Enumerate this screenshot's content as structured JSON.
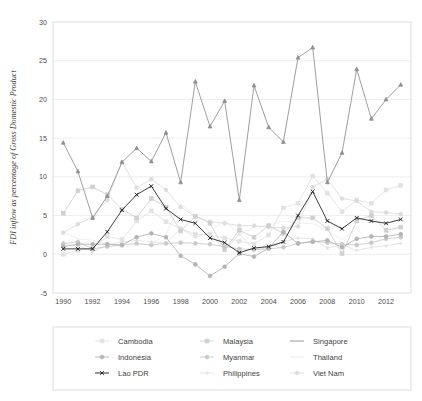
{
  "figure": {
    "width": 422,
    "height": 401,
    "background": "#ffffff"
  },
  "chart_data": {
    "type": "line",
    "title": "",
    "subtitle": "",
    "xlabel": "",
    "ylabel": "FDI inflow as percentage of Gross Domestic Product",
    "xlim": [
      1989.3,
      2013.7
    ],
    "ylim": [
      -5,
      30
    ],
    "yticks": [
      -5,
      0,
      5,
      10,
      15,
      20,
      25,
      30
    ],
    "ytick_labels": [
      "-5",
      "0",
      "5",
      "10",
      "15",
      "20",
      "25",
      "30"
    ],
    "xticks": [
      1990,
      1992,
      1994,
      1996,
      1998,
      2000,
      2002,
      2004,
      2006,
      2008,
      2010,
      2012
    ],
    "xtick_labels": [
      "1990",
      "1992",
      "1994",
      "1996",
      "1998",
      "2000",
      "2002",
      "2004",
      "2006",
      "2008",
      "2010",
      "2012"
    ],
    "grid": "horizontal",
    "legend_position": "below",
    "legend_columns": 3,
    "x": [
      1990,
      1991,
      1992,
      1993,
      1994,
      1995,
      1996,
      1997,
      1998,
      1999,
      2000,
      2001,
      2002,
      2003,
      2004,
      2005,
      2006,
      2007,
      2008,
      2009,
      2010,
      2011,
      2012,
      2013
    ],
    "series": [
      {
        "name": "Cambodia",
        "color": "#e2e2e2",
        "marker": "square",
        "values": [
          0.0,
          0.5,
          0.8,
          2.3,
          1.9,
          4.3,
          5.6,
          4.2,
          3.3,
          2.6,
          2.5,
          2.1,
          1.7,
          1.3,
          2.5,
          6.0,
          6.6,
          10.1,
          7.9,
          5.5,
          7.0,
          6.6,
          8.3,
          8.9
        ]
      },
      {
        "name": "Indonesia",
        "color": "#b4b4b4",
        "marker": "circle",
        "values": [
          1.0,
          1.3,
          1.3,
          1.3,
          1.2,
          2.2,
          2.7,
          2.2,
          -0.2,
          -1.3,
          -2.8,
          -1.6,
          0.1,
          -0.3,
          0.8,
          2.9,
          1.4,
          1.6,
          1.8,
          0.9,
          2.0,
          2.3,
          2.3,
          2.6
        ]
      },
      {
        "name": "Lao PDR",
        "color": "#1a1a1a",
        "marker": "x",
        "values": [
          0.7,
          0.7,
          0.7,
          2.9,
          5.7,
          7.7,
          8.8,
          5.9,
          4.5,
          4.0,
          2.1,
          1.5,
          0.2,
          0.8,
          1.0,
          1.6,
          5.0,
          8.1,
          4.3,
          3.3,
          4.7,
          4.3,
          4.0,
          4.5
        ]
      },
      {
        "name": "Malaysia",
        "color": "#d0d0d0",
        "marker": "square",
        "values": [
          5.3,
          8.2,
          8.7,
          7.7,
          5.8,
          4.7,
          7.2,
          6.1,
          3.0,
          4.9,
          4.0,
          0.6,
          3.1,
          2.2,
          3.7,
          2.7,
          4.7,
          4.7,
          3.3,
          0.1,
          4.3,
          5.0,
          3.1,
          3.5
        ]
      },
      {
        "name": "Myanmar",
        "color": "#c9c9c9",
        "marker": "circle",
        "values": [
          1.4,
          1.6,
          0.7,
          1.0,
          1.2,
          1.4,
          1.2,
          1.4,
          1.5,
          1.4,
          1.3,
          1.0,
          0.7,
          0.6,
          0.7,
          0.9,
          1.4,
          1.7,
          1.5,
          1.3,
          1.2,
          1.5,
          2.0,
          2.2
        ]
      },
      {
        "name": "Philippines",
        "color": "#e0e0e0",
        "marker": "plus",
        "values": [
          1.2,
          1.2,
          0.3,
          1.2,
          1.6,
          1.8,
          1.6,
          1.4,
          3.3,
          2.2,
          2.8,
          0.5,
          2.6,
          0.6,
          0.9,
          1.6,
          2.1,
          2.0,
          0.8,
          1.2,
          0.5,
          0.9,
          1.1,
          1.4
        ]
      },
      {
        "name": "Singapore",
        "color": "#8e8e8e",
        "marker": "triangle",
        "values": [
          14.4,
          10.7,
          4.7,
          7.5,
          11.9,
          13.7,
          12.0,
          15.7,
          9.3,
          22.3,
          16.5,
          19.8,
          7.0,
          21.8,
          16.4,
          14.5,
          25.4,
          26.7,
          9.3,
          13.1,
          23.9,
          17.5,
          20.0,
          21.9
        ]
      },
      {
        "name": "Thailand",
        "color": "#ececec",
        "marker": "none",
        "values": [
          2.9,
          2.0,
          1.8,
          1.4,
          0.9,
          1.2,
          1.3,
          2.6,
          6.5,
          5.0,
          2.8,
          4.4,
          2.5,
          3.5,
          3.7,
          4.3,
          4.0,
          4.0,
          3.1,
          1.9,
          3.3,
          1.0,
          2.7,
          3.6
        ]
      },
      {
        "name": "Viet Nam",
        "color": "#dcdcdc",
        "marker": "circle",
        "values": [
          2.8,
          3.9,
          4.8,
          7.0,
          11.9,
          8.6,
          9.7,
          8.3,
          6.1,
          4.9,
          4.2,
          4.0,
          3.7,
          3.7,
          3.5,
          3.4,
          3.6,
          8.7,
          9.7,
          7.2,
          6.9,
          5.5,
          5.4,
          5.2
        ]
      }
    ]
  },
  "legend": {
    "entries": [
      {
        "label": "Cambodia",
        "color": "#e2e2e2",
        "marker": "square"
      },
      {
        "label": "Malaysia",
        "color": "#d0d0d0",
        "marker": "square"
      },
      {
        "label": "Singapore",
        "color": "#8e8e8e",
        "marker": "line"
      },
      {
        "label": "Indonesia",
        "color": "#b4b4b4",
        "marker": "circle"
      },
      {
        "label": "Myanmar",
        "color": "#c9c9c9",
        "marker": "circle"
      },
      {
        "label": "Thailand",
        "color": "#ececec",
        "marker": "line"
      },
      {
        "label": "Lao PDR",
        "color": "#1a1a1a",
        "marker": "x"
      },
      {
        "label": "Philippines",
        "color": "#e0e0e0",
        "marker": "plus"
      },
      {
        "label": "Viet Nam",
        "color": "#dcdcdc",
        "marker": "circle"
      }
    ]
  }
}
